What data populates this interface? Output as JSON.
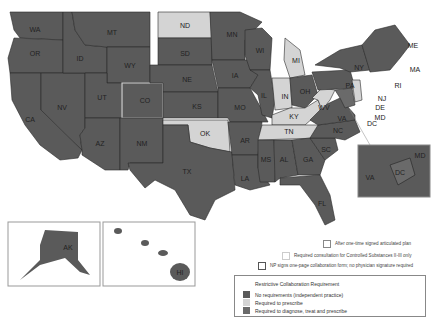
{
  "colors": {
    "independent": "#5a5a5a",
    "prescribe": "#d4d4d4",
    "diagnose": "#6a6a6a",
    "outline_light": "#cfcfcf",
    "background": "#ffffff"
  },
  "states": {
    "WA": "WA",
    "OR": "OR",
    "CA": "CA",
    "NV": "NV",
    "ID": "ID",
    "MT": "MT",
    "WY": "WY",
    "UT": "UT",
    "CO": "CO",
    "AZ": "AZ",
    "NM": "NM",
    "ND": "ND",
    "SD": "SD",
    "NE": "NE",
    "KS": "KS",
    "OK": "OK",
    "TX": "TX",
    "MN": "MN",
    "IA": "IA",
    "MO": "MO",
    "AR": "AR",
    "LA": "LA",
    "WI": "WI",
    "IL": "IL",
    "MI": "MI",
    "IN": "IN",
    "OH": "OH",
    "KY": "KY",
    "TN": "TN",
    "MS": "MS",
    "AL": "AL",
    "GA": "GA",
    "FL": "FL",
    "SC": "SC",
    "NC": "NC",
    "VA": "VA",
    "WV": "WV",
    "PA": "PA",
    "NY": "NY",
    "ME": "ME",
    "MA": "MA",
    "RI": "RI",
    "NJ": "NJ",
    "DE": "DE",
    "MD": "MD",
    "DC": "DC",
    "AK": "AK",
    "HI": "HI"
  },
  "inset": {
    "va": "VA",
    "dc": "DC",
    "md": "MD"
  },
  "legend_top": {
    "item1": "After one-time signed articulated plan",
    "item2": "Required consultation for Controlled Substances II-III only",
    "item3": "NP signs one-page collaboration form; no physician signature required"
  },
  "legend": {
    "title": "Restrictive Collaboration Requirement",
    "items": [
      {
        "label": "No requirements (independent practice)",
        "color": "#5a5a5a"
      },
      {
        "label": "Required to prescribe",
        "color": "#d4d4d4"
      },
      {
        "label": "Required to diagnose, treat and prescribe",
        "color": "#6a6a6a"
      }
    ]
  }
}
